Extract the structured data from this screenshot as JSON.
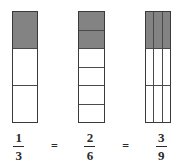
{
  "figure": {
    "background_color": "#ffffff",
    "shade_color": "#838383",
    "outline_color": "#3a3a3a"
  },
  "bars": [
    {
      "name": "thirds",
      "columns": 1,
      "rows": 3,
      "total_parts": 3,
      "shaded_parts": 1,
      "shaded_cells": [
        [
          true
        ],
        [
          false
        ],
        [
          false
        ]
      ]
    },
    {
      "name": "sixths",
      "columns": 1,
      "rows": 6,
      "total_parts": 6,
      "shaded_parts": 2,
      "shaded_cells": [
        [
          true
        ],
        [
          true
        ],
        [
          false
        ],
        [
          false
        ],
        [
          false
        ],
        [
          false
        ]
      ]
    },
    {
      "name": "ninths",
      "columns": 3,
      "rows": 3,
      "total_parts": 9,
      "shaded_parts": 3,
      "shaded_cells": [
        [
          true,
          true,
          true
        ],
        [
          false,
          false,
          false
        ],
        [
          false,
          false,
          false
        ]
      ]
    }
  ],
  "equation": {
    "terms": [
      {
        "type": "fraction",
        "numerator": "1",
        "denominator": "3"
      },
      {
        "type": "operator",
        "symbol": "="
      },
      {
        "type": "fraction",
        "numerator": "2",
        "denominator": "6"
      },
      {
        "type": "operator",
        "symbol": "="
      },
      {
        "type": "fraction",
        "numerator": "3",
        "denominator": "9"
      }
    ]
  },
  "chart_data": {
    "type": "bar",
    "title": "",
    "categories": [
      "1/3",
      "2/6",
      "3/9"
    ],
    "values": [
      0.3333,
      0.3333,
      0.3333
    ],
    "xlabel": "",
    "ylabel": "",
    "ylim": [
      0,
      1
    ],
    "annotations": [
      "1/3 = 2/6 = 3/9"
    ]
  }
}
